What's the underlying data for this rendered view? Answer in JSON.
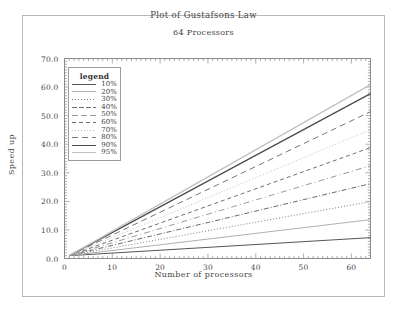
{
  "chart_data": {
    "type": "line",
    "title": "Plot of Gustafsons Law",
    "subtitle": "64 Processors",
    "xlabel": "Number of processors",
    "ylabel": "Speed up",
    "xlim": [
      0,
      64
    ],
    "ylim": [
      0,
      70
    ],
    "xticks": [
      "0",
      "10",
      "20",
      "30",
      "40",
      "50",
      "60"
    ],
    "xtick_values": [
      0,
      10,
      20,
      30,
      40,
      50,
      60
    ],
    "yticks": [
      "0.0",
      "10.0",
      "20.0",
      "30.0",
      "40.0",
      "50.0",
      "60.0",
      "70.0"
    ],
    "ytick_values": [
      0,
      10,
      20,
      30,
      40,
      50,
      60,
      70
    ],
    "grid": false,
    "legend_position": "upper-left",
    "legend_title": "legend",
    "x": [
      1,
      64
    ],
    "series": [
      {
        "name": "10%",
        "values": [
          1,
          7.3
        ],
        "dash": "none",
        "color": "#555555",
        "width": 1.0
      },
      {
        "name": "20%",
        "values": [
          1,
          13.6
        ],
        "dash": "none",
        "color": "#b0b0b0",
        "width": 1.0
      },
      {
        "name": "30%",
        "values": [
          1,
          19.9
        ],
        "dash": "1,2",
        "color": "#808080",
        "width": 1.0
      },
      {
        "name": "40%",
        "values": [
          1,
          26.2
        ],
        "dash": "5,2,1,2",
        "color": "#6a6a6a",
        "width": 1.0
      },
      {
        "name": "50%",
        "values": [
          1,
          32.5
        ],
        "dash": "6,3,1,3",
        "color": "#9a9a9a",
        "width": 1.0
      },
      {
        "name": "60%",
        "values": [
          1,
          38.8
        ],
        "dash": "4,3",
        "color": "#707070",
        "width": 1.0
      },
      {
        "name": "70%",
        "values": [
          1,
          45.1
        ],
        "dash": "1,2",
        "color": "#bdbdbd",
        "width": 1.0
      },
      {
        "name": "80%",
        "values": [
          1,
          51.4
        ],
        "dash": "6,4",
        "color": "#777777",
        "width": 1.0
      },
      {
        "name": "90%",
        "values": [
          1,
          57.7
        ],
        "dash": "none",
        "color": "#4a4a4a",
        "width": 1.2
      },
      {
        "name": "95%",
        "values": [
          1,
          60.85
        ],
        "dash": "none",
        "color": "#c0c0c0",
        "width": 1.2
      }
    ]
  }
}
